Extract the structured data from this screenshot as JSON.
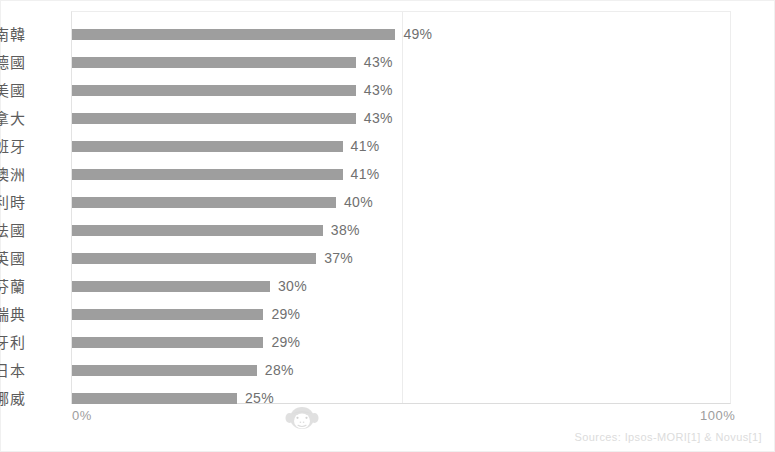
{
  "chart_data": {
    "type": "bar",
    "orientation": "horizontal",
    "title": "",
    "xlabel": "",
    "ylabel": "",
    "xlim": [
      0,
      100
    ],
    "xtick_labels": [
      "0%",
      "100%"
    ],
    "xticks": [
      0,
      100
    ],
    "gridlines": [
      50
    ],
    "grid": true,
    "legend": null,
    "categories": [
      "南韓",
      "德國",
      "美國",
      "加拿大",
      "西班牙",
      "澳洲",
      "比利時",
      "法國",
      "英國",
      "芬蘭",
      "瑞典",
      "匈牙利",
      "日本",
      "挪威"
    ],
    "values": [
      49,
      43,
      43,
      43,
      41,
      41,
      40,
      38,
      37,
      30,
      29,
      29,
      28,
      25
    ],
    "value_labels": [
      "49%",
      "43%",
      "43%",
      "43%",
      "41%",
      "41%",
      "40%",
      "38%",
      "37%",
      "30%",
      "29%",
      "29%",
      "28%",
      "25%"
    ],
    "bar_color": "#9e9e9e",
    "background_color": "#ffffff"
  },
  "axis": {
    "left_tick": "0%",
    "right_tick": "100%"
  },
  "footer": {
    "sources": "Sources: Ipsos-MORI[1] & Novus[1]"
  },
  "watermark": {
    "name": "monkey-face-watermark"
  }
}
